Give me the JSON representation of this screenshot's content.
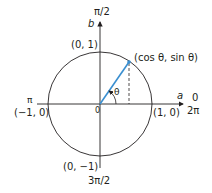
{
  "diagram": {
    "colors": {
      "axes": "#231f20",
      "circle": "#231f20",
      "radius": "#3a8fd0",
      "dashed": "#231f20"
    },
    "axes": {
      "vertical_label": "b",
      "horizontal_label": "a"
    },
    "angle_labels": {
      "top": "π/2",
      "right_top": "0",
      "right_bottom": "2π",
      "left": "π",
      "bottom": "3π/2"
    },
    "point_labels": {
      "top": "(0, 1)",
      "right": "(1, 0)",
      "left": "(−1, 0)",
      "bottom": "(0, −1)",
      "origin": "0",
      "on_circle": "(cos θ, sin θ)"
    },
    "angle_symbol": "θ"
  }
}
